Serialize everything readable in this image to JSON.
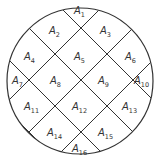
{
  "diagram": {
    "type": "partitioned-circle",
    "circle": {
      "cx": 80,
      "cy": 81,
      "r": 73,
      "stroke": "#333333"
    },
    "line_color": "#333333",
    "regions": [
      {
        "id": "A1",
        "letter": "A",
        "sub": "1",
        "x": 74,
        "y": 14
      },
      {
        "id": "A2",
        "letter": "A",
        "sub": "2",
        "x": 49,
        "y": 34
      },
      {
        "id": "A3",
        "letter": "A",
        "sub": "3",
        "x": 100,
        "y": 34
      },
      {
        "id": "A4",
        "letter": "A",
        "sub": "4",
        "x": 24,
        "y": 60
      },
      {
        "id": "A5",
        "letter": "A",
        "sub": "5",
        "x": 74,
        "y": 60
      },
      {
        "id": "A6",
        "letter": "A",
        "sub": "6",
        "x": 125,
        "y": 60
      },
      {
        "id": "A7",
        "letter": "A",
        "sub": "7",
        "x": 12,
        "y": 84
      },
      {
        "id": "A8",
        "letter": "A",
        "sub": "8",
        "x": 50,
        "y": 84
      },
      {
        "id": "A9",
        "letter": "A",
        "sub": "9",
        "x": 98,
        "y": 84
      },
      {
        "id": "A10",
        "letter": "A",
        "sub": "10",
        "x": 134,
        "y": 84
      },
      {
        "id": "A11",
        "letter": "A",
        "sub": "11",
        "x": 24,
        "y": 110
      },
      {
        "id": "A12",
        "letter": "A",
        "sub": "12",
        "x": 72,
        "y": 110
      },
      {
        "id": "A13",
        "letter": "A",
        "sub": "13",
        "x": 122,
        "y": 110
      },
      {
        "id": "A14",
        "letter": "A",
        "sub": "14",
        "x": 47,
        "y": 136
      },
      {
        "id": "A15",
        "letter": "A",
        "sub": "15",
        "x": 98,
        "y": 136
      },
      {
        "id": "A16",
        "letter": "A",
        "sub": "16",
        "x": 72,
        "y": 152
      }
    ]
  }
}
